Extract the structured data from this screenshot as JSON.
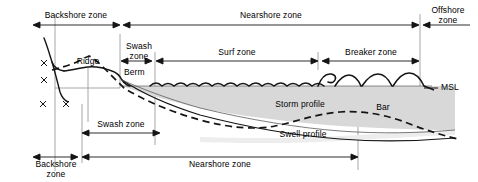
{
  "figure": {
    "type": "coastal-cross-section"
  },
  "zone_bars_top": [
    {
      "label": "Backshore zone",
      "x1": 33,
      "x2": 120,
      "y": 25,
      "label_x": 76,
      "label_y": 11
    },
    {
      "label": "Nearshore zone",
      "x1": 123,
      "x2": 419,
      "y": 25,
      "label_x": 271,
      "label_y": 11
    },
    {
      "label": "Offshore\nzone",
      "x1": 423,
      "x2": 470,
      "y": 25,
      "label_x": 448,
      "label_y": 6
    }
  ],
  "zone_bars_mid": [
    {
      "label": "Swash\nzone",
      "x1": 121,
      "x2": 152,
      "y": 61,
      "label_x": 137,
      "label_y": 42
    },
    {
      "label": "Surf zone",
      "x1": 156,
      "x2": 318,
      "y": 61,
      "label_x": 237,
      "label_y": 48
    },
    {
      "label": "Breaker zone",
      "x1": 322,
      "x2": 419,
      "y": 61,
      "label_x": 371,
      "label_y": 48
    }
  ],
  "zone_bars_lower": [
    {
      "label": "Swash zone",
      "x1": 82,
      "x2": 160,
      "y": 133,
      "label_x": 121,
      "label_y": 120
    }
  ],
  "zone_bars_bottom": [
    {
      "label": "Backshore\nzone",
      "x1": 33,
      "x2": 78,
      "y": 157,
      "label_x": 56,
      "label_y": 160
    },
    {
      "label": "Nearshore zone",
      "x1": 82,
      "x2": 358,
      "y": 157,
      "label_x": 220,
      "label_y": 160
    }
  ],
  "feature_labels": [
    {
      "name": "ridge",
      "text": "Ridge",
      "x": 88,
      "y": 62
    },
    {
      "name": "berm",
      "text": "Berm",
      "x": 124,
      "y": 71
    },
    {
      "name": "storm-profile",
      "text": "Storm profile",
      "x": 265,
      "y": 104
    },
    {
      "name": "bar",
      "text": "Bar",
      "x": 377,
      "y": 107
    },
    {
      "name": "swell-profile",
      "text": "Swell profile",
      "x": 268,
      "y": 133
    },
    {
      "name": "msl",
      "text": "MSL",
      "x": 443,
      "y": 88
    }
  ],
  "dune_marks": [
    {
      "x": 44,
      "y": 63
    },
    {
      "x": 44,
      "y": 80
    },
    {
      "x": 43,
      "y": 104
    },
    {
      "x": 66,
      "y": 104
    }
  ],
  "colors": {
    "line": "#1a1a1a",
    "fill_water": "#d6d6d6",
    "fill_sand": "#e8e8e8",
    "guide": "#8c8c8c",
    "background": "#ffffff"
  },
  "geometry": {
    "msl_y": 88,
    "frame": {
      "x": 0,
      "y": 0,
      "w": 478,
      "h": 182
    },
    "guides_x": [
      55,
      120,
      155,
      318,
      420,
      358,
      82
    ]
  }
}
